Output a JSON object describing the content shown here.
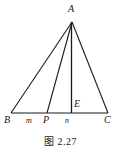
{
  "figure": {
    "caption": "图 2.27",
    "background_color": "#ffffff",
    "stroke_color": "#1a1a1a",
    "labels": {
      "apex": "A",
      "left_vertex": "B",
      "right_vertex": "C",
      "base_point_p": "P",
      "foot_point_e": "E",
      "segment_m": "m",
      "segment_n": "n"
    },
    "geometry": {
      "type": "triangle-with-cevian-and-altitude",
      "points": {
        "A": [
          72,
          22
        ],
        "B": [
          11,
          113
        ],
        "C": [
          108,
          113
        ],
        "P": [
          47,
          113
        ],
        "E": [
          71,
          113
        ]
      },
      "segments": [
        {
          "name": "AB",
          "from": "A",
          "to": "B"
        },
        {
          "name": "AC",
          "from": "A",
          "to": "C"
        },
        {
          "name": "BC",
          "from": "B",
          "to": "C"
        },
        {
          "name": "AP",
          "from": "A",
          "to": "P"
        },
        {
          "name": "AE",
          "from": "A",
          "to": "E"
        }
      ]
    }
  }
}
